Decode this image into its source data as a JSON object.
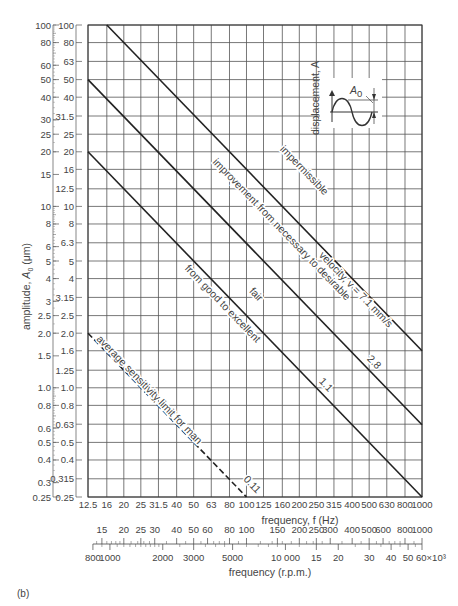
{
  "chart_data": {
    "type": "line",
    "title": "",
    "xlabel": "frequency, f (Hz)",
    "ylabel": "amplitude, A0 (μm)",
    "xscale": "log",
    "yscale": "log",
    "xlim": [
      12.5,
      1000
    ],
    "ylim": [
      0.25,
      100
    ],
    "grid": true,
    "x_ticks": [
      "12.5",
      "16",
      "20",
      "25",
      "31.5",
      "40",
      "50",
      "63",
      "80",
      "100",
      "125",
      "160",
      "200",
      "250",
      "315",
      "400",
      "500",
      "630",
      "800",
      "1000"
    ],
    "y_ticks_inner": [
      "100",
      "80",
      "63",
      "50",
      "40",
      "31.5",
      "25",
      "20",
      "16",
      "12.5",
      "10",
      "8",
      "6.3",
      "5",
      "4",
      "3.15",
      "2.5",
      "2.0",
      "1.6",
      "1.25",
      "1.0",
      "0.8",
      "0.63",
      "0.5",
      "0.4",
      "0.315",
      "0.25"
    ],
    "y_ticks_outer": [
      "100",
      "80",
      "60",
      "50",
      "40",
      "30",
      "25",
      "20",
      "15",
      "10",
      "8",
      "6",
      "5",
      "4",
      "3",
      "2.5",
      "2.0",
      "1.5",
      "1.0",
      "0.8",
      "0.6",
      "0.5",
      "0.4",
      "0.3",
      "0.25"
    ],
    "secondary_x_axis": {
      "label": "frequency (r.p.m.)",
      "top_ticks": [
        "15",
        "20",
        "25",
        "30",
        "40",
        "50",
        "60",
        "80",
        "100",
        "150",
        "200",
        "250",
        "300",
        "400",
        "500",
        "600",
        "800",
        "1000"
      ],
      "bottom_ticks": [
        "800",
        "1000",
        "2000",
        "3000",
        "5000",
        "10 000",
        "15",
        "20",
        "30",
        "40",
        "50",
        "60×10³"
      ]
    },
    "series": [
      {
        "name": "velocity, v = 7.1 mm/s",
        "label": "7.1",
        "style": "solid",
        "points": [
          [
            16,
            100
          ],
          [
            1000,
            1.6
          ]
        ]
      },
      {
        "name": "2.8",
        "label": "2.8",
        "style": "solid",
        "points": [
          [
            12.5,
            50
          ],
          [
            1000,
            0.625
          ]
        ]
      },
      {
        "name": "1.1",
        "label": "1.1",
        "style": "solid",
        "points": [
          [
            12.5,
            20
          ],
          [
            1000,
            0.25
          ]
        ]
      },
      {
        "name": "0.11",
        "label": "0.11",
        "style": "dashed",
        "points": [
          [
            12.5,
            2
          ],
          [
            100,
            0.25
          ]
        ]
      }
    ],
    "zones": [
      {
        "label": "impermissible"
      },
      {
        "label": "improvement from necessary to desirable"
      },
      {
        "label": "fair"
      },
      {
        "label": "from good to excellent"
      },
      {
        "label": "average sensitivity limit for man"
      }
    ],
    "annotations": {
      "inset_label": "displacement, A",
      "inset_amp": "A0"
    }
  },
  "labels": {
    "xlabel": "frequency, f (Hz)",
    "xlabel2": "frequency (r.p.m.)",
    "ylabel": "amplitude, A",
    "ylabel_sub": "0",
    "ylabel_unit": " (μm)",
    "caption": "(b)",
    "z_imperm": "impermissible",
    "z_improve": "improvement from necessary to desirable",
    "z_fair": "fair",
    "z_good": "from good to excellent",
    "z_avg": "average sensitivity limit for man",
    "l71": "velocity, v = 7.1 mm/s",
    "l28": "2.8",
    "l11": "1.1",
    "l011": "0.11",
    "inset": "displacement, A",
    "inset_a": "A",
    "inset_a_sub": "0",
    "rpm_exp": "60×10³"
  }
}
